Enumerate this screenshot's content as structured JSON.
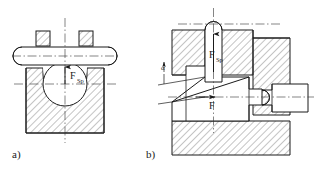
{
  "figure": {
    "background_color": "#ffffff",
    "line_color": "#1a1a1a",
    "hatch_color": "#555555",
    "centerline_color": "#333333"
  },
  "captions": [
    {
      "id": "caption-a",
      "text": "a)"
    },
    {
      "id": "caption-b",
      "text": "b)"
    }
  ],
  "panel_a": {
    "caption": "a)",
    "force_label": {
      "symbol": "F",
      "subscript": "Sp",
      "direction": "up",
      "arrow_name": "force-arrow-vertical"
    },
    "elements": [
      "body-block",
      "bore-circle",
      "cross-pin",
      "lug-left",
      "lug-right",
      "vertical-centerline",
      "horizontal-centerline",
      "pin-axis-centerline"
    ]
  },
  "panel_b": {
    "caption": "b)",
    "force_label_vertical": {
      "symbol": "F",
      "subscript": "Sp",
      "direction": "up",
      "arrow_name": "force-arrow-vertical"
    },
    "force_label_horizontal": {
      "symbol": "F",
      "subscript": "",
      "direction": "right",
      "arrow_name": "force-arrow-horizontal"
    },
    "angle_label": {
      "symbol": "α",
      "name": "wedge-angle-alpha"
    },
    "elements": [
      "housing-block-left",
      "housing-block-right",
      "housing-block-bottom",
      "wedge-slide",
      "vertical-rod",
      "horizontal-plunger",
      "angle-leader-lines",
      "vertical-centerline",
      "horizontal-centerline",
      "top-centerline"
    ]
  }
}
